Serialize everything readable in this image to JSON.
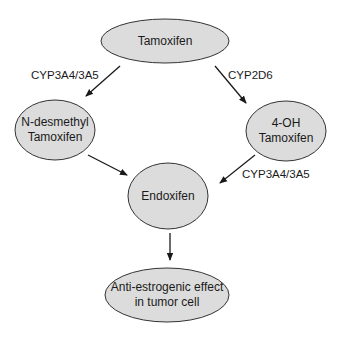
{
  "diagram": {
    "colors": {
      "node_fill": "#dcdcdc",
      "node_stroke": "#333333",
      "edge": "#1a1a1a",
      "text": "#1a1a1a"
    },
    "nodes": [
      {
        "id": "tamoxifen",
        "lines": [
          "Tamoxifen"
        ]
      },
      {
        "id": "n-desmethyl",
        "lines": [
          "N-desmethyl",
          "Tamoxifen"
        ]
      },
      {
        "id": "4-oh",
        "lines": [
          "4-OH",
          "Tamoxifen"
        ]
      },
      {
        "id": "endoxifen",
        "lines": [
          "Endoxifen"
        ]
      },
      {
        "id": "effect",
        "lines": [
          "Anti-estrogenic effect",
          "in tumor cell"
        ]
      }
    ],
    "edges": [
      {
        "from": "tamoxifen",
        "to": "n-desmethyl",
        "label": "CYP3A4/3A5"
      },
      {
        "from": "tamoxifen",
        "to": "4-oh",
        "label": "CYP2D6"
      },
      {
        "from": "n-desmethyl",
        "to": "endoxifen",
        "label": ""
      },
      {
        "from": "4-oh",
        "to": "endoxifen",
        "label": "CYP3A4/3A5"
      },
      {
        "from": "endoxifen",
        "to": "effect",
        "label": ""
      }
    ]
  }
}
